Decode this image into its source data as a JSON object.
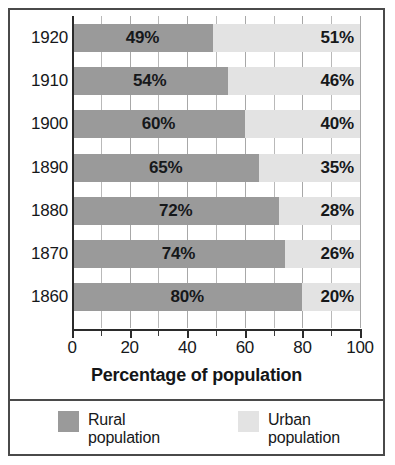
{
  "chart_data": {
    "type": "bar",
    "orientation": "horizontal",
    "stacked": true,
    "stacked_total": 100,
    "title": "",
    "xlabel": "Percentage of population",
    "ylabel": "",
    "xlim": [
      0,
      100
    ],
    "xticks": [
      "0",
      "20",
      "40",
      "60",
      "80",
      "100"
    ],
    "xtick_values": [
      0,
      20,
      40,
      60,
      80,
      100
    ],
    "minor_tick_interval": 10,
    "grid": true,
    "grid_axis": "x",
    "legend_position": "bottom",
    "categories": [
      "1920",
      "1910",
      "1900",
      "1890",
      "1880",
      "1870",
      "1860"
    ],
    "series": [
      {
        "name": "Rural population",
        "color": "#9a9a9a",
        "values": [
          49,
          54,
          60,
          65,
          72,
          74,
          80
        ],
        "data_labels": [
          "49%",
          "54%",
          "60%",
          "65%",
          "72%",
          "74%",
          "80%"
        ]
      },
      {
        "name": "Urban population",
        "color": "#e3e3e3",
        "values": [
          51,
          46,
          40,
          35,
          28,
          26,
          20
        ],
        "data_labels": [
          "51%",
          "46%",
          "40%",
          "35%",
          "28%",
          "26%",
          "20%"
        ]
      }
    ]
  },
  "legend": {
    "items": [
      {
        "label_line1": "Rural",
        "label_line2": "population",
        "color": "#9a9a9a"
      },
      {
        "label_line1": "Urban",
        "label_line2": "population",
        "color": "#e3e3e3"
      }
    ]
  }
}
